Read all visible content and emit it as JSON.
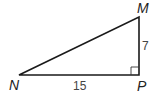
{
  "diagram": {
    "type": "right-triangle",
    "vertices": {
      "N": {
        "label": "N",
        "x": 19,
        "y": 75
      },
      "M": {
        "label": "M",
        "x": 139,
        "y": 17
      },
      "P": {
        "label": "P",
        "x": 139,
        "y": 75
      }
    },
    "sides": {
      "NP": {
        "label": "15"
      },
      "MP": {
        "label": "7"
      },
      "NM": {
        "label": ""
      }
    },
    "right_angle_at": "P",
    "colors": {
      "stroke": "#1a1a1a",
      "text": "#222222",
      "background": "#ffffff"
    }
  }
}
